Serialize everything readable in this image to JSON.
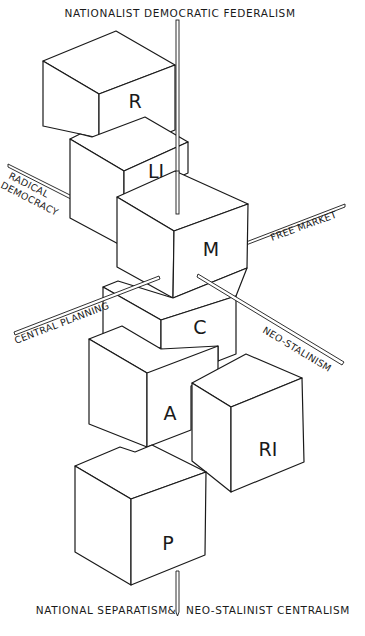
{
  "diagram": {
    "axes": {
      "top": "Nationalist Democratic Federalism",
      "bottom_left": "National Separatism",
      "bottom_connector": "&",
      "bottom_right": "Neo-Stalinist Centralism",
      "upper_left_line1": "Radical",
      "upper_left_line2": "Democracy",
      "right": "Free Market",
      "lower_left": "Central Planning",
      "lower_right": "Neo-Stalinism"
    },
    "cubes": [
      {
        "id": "R",
        "label": "R"
      },
      {
        "id": "LI",
        "label": "LI"
      },
      {
        "id": "M",
        "label": "M"
      },
      {
        "id": "C",
        "label": "C"
      },
      {
        "id": "A",
        "label": "A"
      },
      {
        "id": "RI",
        "label": "RI"
      },
      {
        "id": "P",
        "label": "P"
      }
    ],
    "colors": {
      "ink": "#1a1a1a",
      "paper": "#ffffff"
    }
  }
}
